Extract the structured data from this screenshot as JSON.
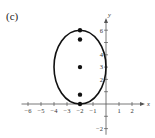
{
  "figure": {
    "label": "(c)"
  },
  "chart_data": {
    "type": "scatter",
    "title": "",
    "xlabel": "x",
    "ylabel": "y",
    "xlim": [
      -6.5,
      3
    ],
    "ylim": [
      -2.5,
      7
    ],
    "xticks": [
      -6,
      -5,
      -4,
      -3,
      -2,
      -1,
      1,
      2
    ],
    "yticks": [
      -2,
      2,
      3,
      4,
      6
    ],
    "xtick_labels": [
      "−6",
      "−5",
      "−4",
      "−3",
      "−2",
      "−1",
      "1",
      "2"
    ],
    "ytick_labels": [
      "−2",
      "2",
      "3",
      "4",
      "6"
    ],
    "grid": false,
    "shapes": [
      {
        "type": "ellipse",
        "center": [
          -2,
          3
        ],
        "semi_axis_x": 2,
        "semi_axis_y": 3
      }
    ],
    "points": [
      {
        "x": -2,
        "y": 6,
        "role": "vertex"
      },
      {
        "x": -2,
        "y": 5.24,
        "role": "focus"
      },
      {
        "x": -2,
        "y": 3,
        "role": "center"
      },
      {
        "x": -2,
        "y": 0.76,
        "role": "focus"
      },
      {
        "x": -2,
        "y": 0,
        "role": "vertex"
      }
    ]
  }
}
